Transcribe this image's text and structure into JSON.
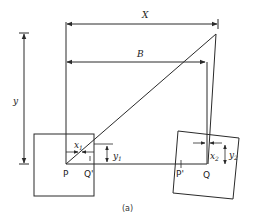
{
  "diagram": {
    "caption": "(a)",
    "labels": {
      "X": "X",
      "B": "B",
      "y": "y",
      "P": "P",
      "Q_prime": "Q'",
      "P_prime": "P'",
      "Q": "Q",
      "x1": "x",
      "x1_sub": "1",
      "y1": "y",
      "y1_sub": "1",
      "x2": "x",
      "x2_sub": "2",
      "y2": "y",
      "y2_sub": "2"
    },
    "colors": {
      "stroke": "#2a2a2a",
      "background": "#ffffff"
    },
    "elements": [
      "dimension-arrow-X",
      "dimension-arrow-B",
      "dimension-arrow-y",
      "left-image-frame",
      "right-image-frame-rotated",
      "ray-P-to-apex",
      "ray-apex-to-Q",
      "baseline-P-to-Q",
      "offset-x1",
      "offset-y1",
      "offset-x2",
      "offset-y2"
    ]
  }
}
